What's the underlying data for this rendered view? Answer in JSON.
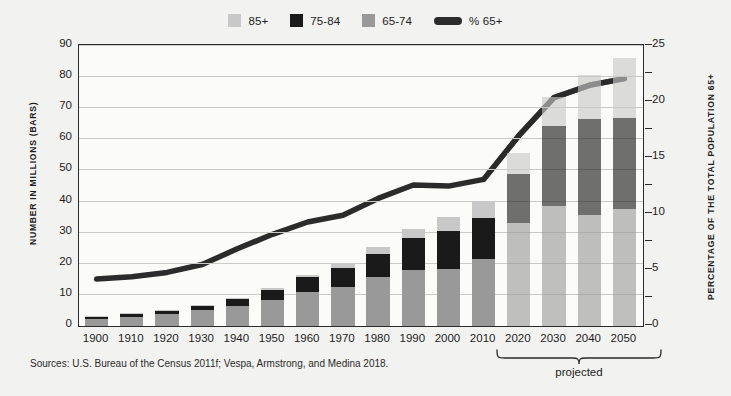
{
  "chart_data": {
    "type": "bar",
    "title": "",
    "subtitle": "",
    "xlabel": "",
    "ylabel": "NUMBER IN MILLIONS (BARS)",
    "ylabel_right": "PERCENTAGE OF THE TOTAL POPULATION 65+",
    "ylim": [
      0,
      90
    ],
    "ylim_right": [
      0,
      25
    ],
    "yticks": [
      "0",
      "10",
      "20",
      "30",
      "40",
      "50",
      "60",
      "70",
      "80",
      "90"
    ],
    "yticks_right": [
      "0",
      "5",
      "10",
      "15",
      "20",
      "25"
    ],
    "grid": true,
    "legend_position": "top-center",
    "stacked": true,
    "categories": [
      "1900",
      "1910",
      "1920",
      "1930",
      "1940",
      "1950",
      "1960",
      "1970",
      "1980",
      "1990",
      "2000",
      "2010",
      "2020",
      "2030",
      "2040",
      "2050"
    ],
    "series": [
      {
        "name": "65-74",
        "color": "#999999",
        "values": [
          2.2,
          3.0,
          3.8,
          5.0,
          6.4,
          8.4,
          11.0,
          12.4,
          15.6,
          18.1,
          18.4,
          21.7,
          33.0,
          38.6,
          35.6,
          37.5
        ]
      },
      {
        "name": "75-84",
        "color": "#1a1a1a",
        "values": [
          0.8,
          1.0,
          1.2,
          1.6,
          2.3,
          3.3,
          4.6,
          6.1,
          7.7,
          10.1,
          12.3,
          13.1,
          15.8,
          25.8,
          30.9,
          29.5
        ]
      },
      {
        "name": "85+",
        "color": "#c8c8c8",
        "values": [
          0.1,
          0.2,
          0.2,
          0.3,
          0.4,
          0.6,
          0.9,
          1.4,
          2.2,
          3.1,
          4.2,
          5.5,
          6.7,
          9.1,
          14.2,
          19.0
        ]
      }
    ],
    "line_series": {
      "name": "% 65+",
      "color": "#2b2b2b",
      "axis": "right",
      "values": [
        4.1,
        4.3,
        4.7,
        5.4,
        6.8,
        8.1,
        9.2,
        9.8,
        11.3,
        12.5,
        12.4,
        13.0,
        16.9,
        20.3,
        21.4,
        22.0
      ]
    },
    "annotations": [
      {
        "name": "projected-bracket",
        "label": "projected",
        "from": "2020",
        "to": "2050"
      }
    ],
    "sources": "Sources: U.S. Bureau of the Census 2011f; Vespa, Armstrong, and Medina 2018."
  },
  "legend": {
    "items": [
      {
        "label": "85+",
        "icon": "square-swatch",
        "color": "#c8c8c8"
      },
      {
        "label": "75-84",
        "icon": "square-swatch",
        "color": "#1a1a1a"
      },
      {
        "label": "65-74",
        "icon": "square-swatch",
        "color": "#999999"
      },
      {
        "label": "% 65+",
        "icon": "line-swatch",
        "color": "#2b2b2b"
      }
    ]
  },
  "style": {
    "background": "#f2f2f0",
    "plot_background": "#fbfbfa",
    "axis_color": "#2b2b2b",
    "grid_color": "#c9c9c6",
    "projected_opacity": 0.62
  }
}
